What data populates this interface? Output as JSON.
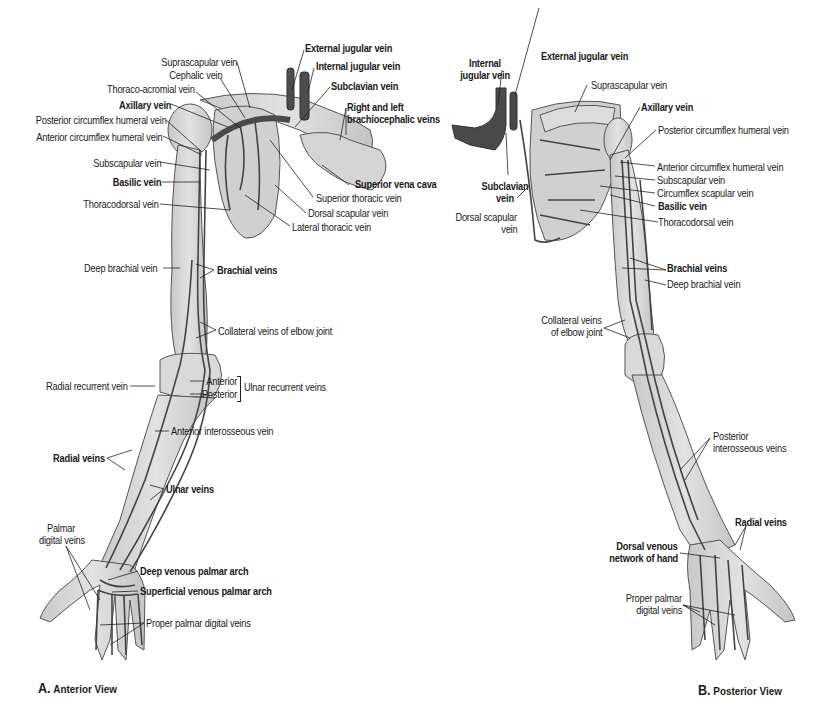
{
  "figure": {
    "colors": {
      "bone": "#d8d8d8",
      "bone_outline": "#555555",
      "vein": "#444444",
      "large_vein": "#505050",
      "leader_line": "#222222",
      "background": "#ffffff"
    }
  },
  "panel_a": {
    "caption_letter": "A.",
    "caption_text": "Anterior View",
    "labels": {
      "external_jugular": "External jugular vein",
      "internal_jugular": "Internal jugular vein",
      "suprascapular": "Suprascapular vein",
      "cephalic": "Cephalic vein",
      "subclavian": "Subclavian vein",
      "thoraco_acromial": "Thoraco-acromial vein",
      "brachiocephalic_1": "Right and left",
      "brachiocephalic_2": "brachiocephalic veins",
      "axillary": "Axillary vein",
      "posterior_circumflex": "Posterior circumflex humeral vein",
      "anterior_circumflex": "Anterior circumflex humeral vein",
      "subscapular": "Subscapular vein",
      "basilic": "Basilic vein",
      "superior_vena_cava": "Superior vena cava",
      "thoracodorsal": "Thoracodorsal vein",
      "superior_thoracic": "Superior thoracic vein",
      "dorsal_scapular": "Dorsal scapular vein",
      "lateral_thoracic": "Lateral thoracic vein",
      "deep_brachial": "Deep brachial vein",
      "brachial": "Brachial veins",
      "collateral_elbow": "Collateral veins of elbow joint",
      "radial_recurrent": "Radial recurrent vein",
      "anterior": "Anterior",
      "posterior": "Posterior",
      "ulnar_recurrent": "Ulnar recurrent veins",
      "anterior_interosseous": "Anterior interosseous vein",
      "radial": "Radial veins",
      "ulnar": "Ulnar veins",
      "palmar_digital_1": "Palmar",
      "palmar_digital_2": "digital veins",
      "deep_palmar_arch": "Deep venous palmar arch",
      "superficial_palmar_arch": "Superficial venous palmar arch",
      "proper_palmar_digital": "Proper palmar digital veins"
    }
  },
  "panel_b": {
    "caption_letter": "B.",
    "caption_text": "Posterior View",
    "labels": {
      "internal_jugular_1": "Internal",
      "internal_jugular_2": "jugular vein",
      "external_jugular": "External jugular vein",
      "suprascapular": "Suprascapular vein",
      "axillary": "Axillary vein",
      "posterior_circumflex": "Posterior circumflex humeral vein",
      "anterior_circumflex": "Anterior circumflex humeral vein",
      "subscapular": "Subscapular vein",
      "circumflex_scapular": "Circumflex scapular vein",
      "basilic": "Basilic vein",
      "subclavian_1": "Subclavian",
      "subclavian_2": "vein",
      "dorsal_scapular_1": "Dorsal scapular",
      "dorsal_scapular_2": "vein",
      "thoracodorsal": "Thoracodorsal vein",
      "brachial": "Brachial veins",
      "deep_brachial": "Deep brachial vein",
      "collateral_elbow_1": "Collateral veins",
      "collateral_elbow_2": "of elbow joint",
      "posterior_interosseous_1": "Posterior",
      "posterior_interosseous_2": "interosseous veins",
      "radial": "Radial veins",
      "dorsal_network_1": "Dorsal venous",
      "dorsal_network_2": "network of hand",
      "proper_palmar_1": "Proper palmar",
      "proper_palmar_2": "digital veins"
    }
  }
}
